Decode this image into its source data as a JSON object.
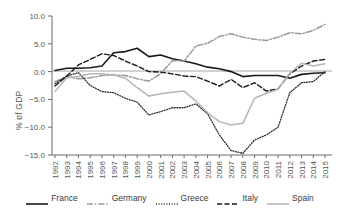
{
  "chart_data": {
    "type": "line",
    "title": "",
    "xlabel": "",
    "ylabel": "% of GDP",
    "ylim": [
      -15.0,
      10.0
    ],
    "yticks": [
      10.0,
      5.0,
      0.0,
      -5.0,
      -10.0,
      -15.0
    ],
    "ytick_labels": [
      "10.0",
      "5.0",
      "0.0",
      "−5.0",
      "−10.0",
      "−15.0"
    ],
    "grid": false,
    "legend_position": "bottom",
    "zero_line": true,
    "categories": [
      1992,
      1993,
      1994,
      1995,
      1996,
      1997,
      1998,
      1999,
      2000,
      2001,
      2002,
      2003,
      2004,
      2005,
      2006,
      2007,
      2008,
      2009,
      2010,
      2011,
      2012,
      2013,
      2014,
      2015
    ],
    "xtick_labels": [
      "1992",
      "1993",
      "1994",
      "1995",
      "1996",
      "1997",
      "1998",
      "1999",
      "2000",
      "2001",
      "2002",
      "2003",
      "2004",
      "2005",
      "2006",
      "2007",
      "2008",
      "2009",
      "2010",
      "2011",
      "2012",
      "2013",
      "2014",
      "2015"
    ],
    "series": [
      {
        "name": "France",
        "color": "#1a1a1a",
        "dash": "none",
        "width": 1.6,
        "values": [
          0.2,
          0.6,
          0.6,
          0.7,
          1.0,
          3.4,
          3.6,
          4.2,
          2.7,
          3.0,
          2.3,
          1.9,
          1.4,
          0.8,
          0.5,
          0.0,
          -0.9,
          -0.7,
          -0.7,
          -0.7,
          -1.2,
          -0.5,
          -0.3,
          -0.2
        ]
      },
      {
        "name": "Germany",
        "color": "#9a9a9a",
        "dash": "dashdot",
        "width": 1.5,
        "values": [
          -1.8,
          -0.9,
          -1.3,
          -1.1,
          -0.7,
          -0.6,
          -0.7,
          -1.3,
          -1.7,
          -0.4,
          2.0,
          1.9,
          4.6,
          5.1,
          6.3,
          6.8,
          6.2,
          5.8,
          5.6,
          6.2,
          7.0,
          6.8,
          7.4,
          8.5
        ]
      },
      {
        "name": "Greece",
        "color": "#2b2b2b",
        "dash": "dot",
        "width": 1.3,
        "values": [
          -2.2,
          -0.8,
          -0.2,
          -2.5,
          -3.6,
          -3.8,
          -4.8,
          -5.5,
          -7.8,
          -7.2,
          -6.5,
          -6.5,
          -5.8,
          -7.6,
          -11.4,
          -14.2,
          -14.7,
          -12.3,
          -11.4,
          -10.0,
          -3.8,
          -2.0,
          -1.8,
          0.0
        ]
      },
      {
        "name": "Italy",
        "color": "#1a1a1a",
        "dash": "dash",
        "width": 1.4,
        "values": [
          -2.6,
          -0.8,
          1.2,
          2.2,
          3.2,
          2.9,
          1.9,
          1.0,
          0.0,
          -0.1,
          -0.4,
          -0.8,
          -0.9,
          -1.7,
          -2.6,
          -1.4,
          -2.9,
          -2.0,
          -3.5,
          -3.1,
          -0.4,
          1.0,
          1.9,
          2.2
        ]
      },
      {
        "name": "Spain",
        "color": "#b5b5b5",
        "dash": "none",
        "width": 1.5,
        "values": [
          -3.6,
          -1.1,
          -0.9,
          -0.4,
          -0.4,
          -0.6,
          -1.2,
          -2.9,
          -4.4,
          -4.0,
          -3.7,
          -3.5,
          -5.3,
          -7.4,
          -9.0,
          -9.6,
          -9.3,
          -4.8,
          -3.9,
          -3.2,
          -0.3,
          1.5,
          1.0,
          1.4
        ]
      }
    ]
  },
  "legend": {
    "items": [
      {
        "label": "France"
      },
      {
        "label": "Germany"
      },
      {
        "label": "Greece"
      },
      {
        "label": "Italy"
      },
      {
        "label": "Spain"
      }
    ]
  }
}
